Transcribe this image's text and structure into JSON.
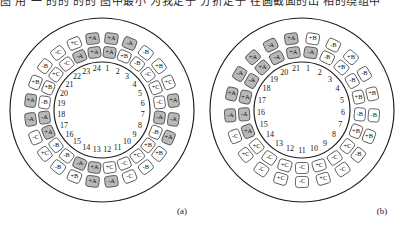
{
  "page": {
    "top_cut_text": "图  用  一  的的  的的  图中最小  为我定子  分折定子 在圆截面的出 相的绕组中",
    "shade_color": "#b9b9b9",
    "plain_color": "#ffffff",
    "line_color": "#1b1b1b"
  },
  "captions": {
    "a": "(a)",
    "b": "(b)"
  },
  "figures": [
    {
      "id": "a",
      "name": "stator-winding-24-slot",
      "slot_count": 24,
      "slots": [
        {
          "n": 1,
          "outer": "+A",
          "inner": "+A",
          "outer_shaded": true,
          "inner_shaded": true
        },
        {
          "n": 2,
          "outer": "-A",
          "inner": "+B",
          "outer_shaded": true,
          "inner_shaded": false
        },
        {
          "n": 3,
          "outer": "-B",
          "inner": "-B",
          "outer_shaded": false,
          "inner_shaded": false
        },
        {
          "n": 4,
          "outer": "+B",
          "inner": "-C",
          "outer_shaded": false,
          "inner_shaded": false
        },
        {
          "n": 5,
          "outer": "+C",
          "inner": "+C",
          "outer_shaded": false,
          "inner_shaded": false
        },
        {
          "n": 6,
          "outer": "+A",
          "inner": "-C",
          "outer_shaded": true,
          "inner_shaded": false
        },
        {
          "n": 7,
          "outer": "-A",
          "inner": "-A",
          "outer_shaded": true,
          "inner_shaded": true
        },
        {
          "n": 8,
          "outer": "+A",
          "inner": "-B",
          "outer_shaded": true,
          "inner_shaded": false
        },
        {
          "n": 9,
          "outer": "+B",
          "inner": "+B",
          "outer_shaded": false,
          "inner_shaded": false
        },
        {
          "n": 10,
          "outer": "-B",
          "inner": "+C",
          "outer_shaded": false,
          "inner_shaded": false
        },
        {
          "n": 11,
          "outer": "-C",
          "inner": "-C",
          "outer_shaded": false,
          "inner_shaded": false
        },
        {
          "n": 12,
          "outer": "-A",
          "inner": "+C",
          "outer_shaded": true,
          "inner_shaded": false
        },
        {
          "n": 13,
          "outer": "+A",
          "inner": "+A",
          "outer_shaded": true,
          "inner_shaded": true
        },
        {
          "n": 14,
          "outer": "+B",
          "inner": "-A",
          "outer_shaded": false,
          "inner_shaded": true
        },
        {
          "n": 15,
          "outer": "-B",
          "inner": "-B",
          "outer_shaded": false,
          "inner_shaded": false
        },
        {
          "n": 16,
          "outer": "+C",
          "inner": "-B",
          "outer_shaded": false,
          "inner_shaded": false
        },
        {
          "n": 17,
          "outer": "-C",
          "inner": "+A",
          "outer_shaded": false,
          "inner_shaded": true
        },
        {
          "n": 18,
          "outer": "-A",
          "inner": "-A",
          "outer_shaded": true,
          "inner_shaded": true
        },
        {
          "n": 19,
          "outer": "+A",
          "inner": "-B",
          "outer_shaded": true,
          "inner_shaded": false
        },
        {
          "n": 20,
          "outer": "+B",
          "inner": "+B",
          "outer_shaded": false,
          "inner_shaded": false
        },
        {
          "n": 21,
          "outer": "-B",
          "inner": "+C",
          "outer_shaded": false,
          "inner_shaded": false
        },
        {
          "n": 22,
          "outer": "-C",
          "inner": "-C",
          "outer_shaded": false,
          "inner_shaded": false
        },
        {
          "n": 23,
          "outer": "+C",
          "inner": "-A",
          "outer_shaded": false,
          "inner_shaded": true
        },
        {
          "n": 24,
          "outer": "+A",
          "inner": "+A",
          "outer_shaded": true,
          "inner_shaded": true
        }
      ]
    },
    {
      "id": "b",
      "name": "stator-winding-21-slot",
      "slot_count": 21,
      "slots": [
        {
          "n": 1,
          "outer": "+B",
          "inner": "-A",
          "outer_shaded": false,
          "inner_shaded": true
        },
        {
          "n": 2,
          "outer": "-B",
          "inner": "-B",
          "outer_shaded": false,
          "inner_shaded": false
        },
        {
          "n": 3,
          "outer": "+B",
          "inner": "+B",
          "outer_shaded": false,
          "inner_shaded": false
        },
        {
          "n": 4,
          "outer": "-B",
          "inner": "-B",
          "outer_shaded": false,
          "inner_shaded": false
        },
        {
          "n": 5,
          "outer": "+B",
          "inner": "+B",
          "outer_shaded": false,
          "inner_shaded": false
        },
        {
          "n": 6,
          "outer": "-B",
          "inner": "-B",
          "outer_shaded": false,
          "inner_shaded": false
        },
        {
          "n": 7,
          "outer": "+B",
          "inner": "+B",
          "outer_shaded": false,
          "inner_shaded": false
        },
        {
          "n": 8,
          "outer": "-B",
          "inner": "+C",
          "outer_shaded": false,
          "inner_shaded": false
        },
        {
          "n": 9,
          "outer": "-C",
          "inner": "-C",
          "outer_shaded": false,
          "inner_shaded": false
        },
        {
          "n": 10,
          "outer": "+C",
          "inner": "+C",
          "outer_shaded": false,
          "inner_shaded": false
        },
        {
          "n": 11,
          "outer": "-C",
          "inner": "-C",
          "outer_shaded": false,
          "inner_shaded": false
        },
        {
          "n": 12,
          "outer": "+C",
          "inner": "+C",
          "outer_shaded": false,
          "inner_shaded": false
        },
        {
          "n": 13,
          "outer": "-C",
          "inner": "-C",
          "outer_shaded": false,
          "inner_shaded": false
        },
        {
          "n": 14,
          "outer": "+C",
          "inner": "+C",
          "outer_shaded": false,
          "inner_shaded": false
        },
        {
          "n": 15,
          "outer": "-C",
          "inner": "+A",
          "outer_shaded": false,
          "inner_shaded": true
        },
        {
          "n": 16,
          "outer": "-A",
          "inner": "-A",
          "outer_shaded": true,
          "inner_shaded": true
        },
        {
          "n": 17,
          "outer": "+A",
          "inner": "+A",
          "outer_shaded": true,
          "inner_shaded": true
        },
        {
          "n": 18,
          "outer": "-A",
          "inner": "-A",
          "outer_shaded": true,
          "inner_shaded": true
        },
        {
          "n": 19,
          "outer": "+A",
          "inner": "+A",
          "outer_shaded": true,
          "inner_shaded": true
        },
        {
          "n": 20,
          "outer": "-A",
          "inner": "-A",
          "outer_shaded": true,
          "inner_shaded": true
        },
        {
          "n": 21,
          "outer": "+A",
          "inner": "+A",
          "outer_shaded": true,
          "inner_shaded": true
        }
      ]
    }
  ],
  "geometry": {
    "cx": 98,
    "cy": 98,
    "r_outer": 92,
    "r_ring": 78,
    "r_cell_outer": 72,
    "r_cell_inner": 58,
    "r_bore": 48,
    "r_slotnum": 41
  }
}
